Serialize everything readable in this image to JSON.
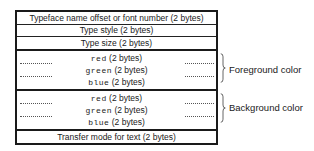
{
  "diagram": {
    "rows": [
      {
        "label": "Typeface name offset or font number (2 bytes)"
      },
      {
        "label": "Type style (2 bytes)"
      },
      {
        "label": "Type size (2 bytes)"
      }
    ],
    "groups": [
      {
        "name": "Foreground color",
        "fields": [
          {
            "name": "red",
            "size": "(2 bytes)"
          },
          {
            "name": "green",
            "size": "(2 bytes)"
          },
          {
            "name": "blue",
            "size": "(2 bytes)"
          }
        ]
      },
      {
        "name": "Background color",
        "fields": [
          {
            "name": "red",
            "size": "(2 bytes)"
          },
          {
            "name": "green",
            "size": "(2 bytes)"
          },
          {
            "name": "blue",
            "size": "(2 bytes)"
          }
        ]
      }
    ],
    "last_row": {
      "label": "Transfer mode for text (2 bytes)"
    }
  }
}
